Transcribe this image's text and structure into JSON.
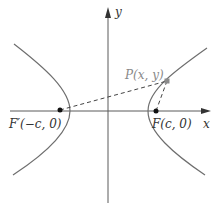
{
  "diagram": {
    "type": "hyperbola-with-foci",
    "axes": {
      "x_label": "x",
      "y_label": "y"
    },
    "foci": {
      "left": {
        "label_name": "F′",
        "label_coords": "(−c, 0)",
        "full_label": "F′(−c, 0)"
      },
      "right": {
        "label_name": "F",
        "label_coords": "(c, 0)",
        "full_label": "F(c, 0)"
      }
    },
    "point": {
      "label": "P(x, y)"
    },
    "segments": [
      {
        "from": "F′",
        "to": "P",
        "style": "dashed"
      },
      {
        "from": "F",
        "to": "P",
        "style": "dashed"
      }
    ],
    "colors": {
      "curve": "#6e6e6e",
      "axis": "#5a5a5a",
      "point_marker": "#8a8a8a",
      "focus_dot": "#111111",
      "label_point": "#8a8a8a",
      "label_text": "#333333"
    }
  }
}
